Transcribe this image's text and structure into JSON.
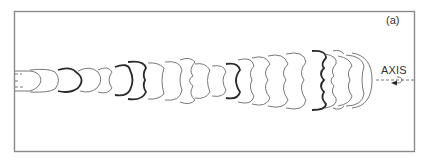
{
  "figure": {
    "panel_label": "(a)",
    "axis_label": "AXIS",
    "colors": {
      "frame": "#8a8a8a",
      "contour": "#6a6a6a",
      "contour_bold": "#2a2a2a",
      "background": "#ffffff"
    },
    "frame": {
      "x": 14,
      "y": 11,
      "width": 400,
      "height": 140
    },
    "axis_y": 80,
    "contour_count": 22,
    "bold_contour_indices": [
      2,
      4,
      5,
      9,
      14,
      17
    ]
  }
}
